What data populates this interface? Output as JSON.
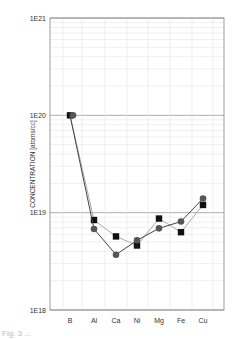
{
  "chart_data": {
    "type": "line",
    "title": "",
    "xlabel": "",
    "ylabel": "CONCENTRATION [atoms/cc]",
    "yscale": "log",
    "ylim": [
      1e+18,
      1e+21
    ],
    "y_ticks": [
      "1E18",
      "1E19",
      "1E20",
      "1E21"
    ],
    "categories": [
      "B",
      "Al",
      "Ca",
      "Ni",
      "Mg",
      "Fe",
      "Cu"
    ],
    "grid": true,
    "legend": null,
    "series": [
      {
        "name": "squares",
        "marker": "square",
        "color": "#111111",
        "line_color": "#aaaaaa",
        "values": [
          1e+20,
          8.4e+18,
          5.7e+18,
          4.6e+18,
          8.7e+18,
          6.3e+18,
          1.2e+19
        ]
      },
      {
        "name": "circles",
        "marker": "circle",
        "color": "#555555",
        "line_color": "#444444",
        "values": [
          1e+20,
          6.8e+18,
          3.7e+18,
          5.2e+18,
          6.9e+18,
          8.1e+18,
          1.4e+19
        ]
      }
    ]
  },
  "caption": "Fig. 3 ..."
}
